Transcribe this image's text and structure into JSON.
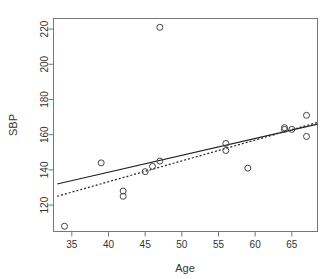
{
  "chart_data": {
    "type": "scatter",
    "title": "",
    "xlabel": "Age",
    "ylabel": "SBP",
    "xlim": [
      32.5,
      68.5
    ],
    "ylim": [
      105,
      226
    ],
    "grid": false,
    "legend": "none",
    "xticks": [
      35,
      40,
      45,
      50,
      55,
      60,
      65
    ],
    "yticks": [
      120,
      140,
      160,
      180,
      200,
      220
    ],
    "x": [
      34,
      39,
      42,
      42,
      45,
      46,
      47,
      47,
      56,
      56,
      59,
      64,
      64,
      65,
      67,
      67
    ],
    "y": [
      108,
      144,
      128,
      125,
      139,
      142,
      145,
      221,
      155,
      151,
      141,
      163,
      164,
      163,
      171,
      159
    ],
    "points": [
      {
        "x": 34,
        "y": 108
      },
      {
        "x": 39,
        "y": 144
      },
      {
        "x": 42,
        "y": 128
      },
      {
        "x": 42,
        "y": 125
      },
      {
        "x": 45,
        "y": 139
      },
      {
        "x": 46,
        "y": 142
      },
      {
        "x": 47,
        "y": 145
      },
      {
        "x": 47,
        "y": 221
      },
      {
        "x": 56,
        "y": 155
      },
      {
        "x": 56,
        "y": 151
      },
      {
        "x": 59,
        "y": 141
      },
      {
        "x": 64,
        "y": 163
      },
      {
        "x": 64,
        "y": 164
      },
      {
        "x": 65,
        "y": 163
      },
      {
        "x": 67,
        "y": 171
      },
      {
        "x": 67,
        "y": 159
      }
    ],
    "marker": "open-circle",
    "marker_radius": 3,
    "series": [
      {
        "name": "observations",
        "type": "scatter",
        "values": [
          108,
          144,
          128,
          125,
          139,
          142,
          145,
          221,
          155,
          151,
          141,
          163,
          164,
          163,
          171,
          159
        ]
      },
      {
        "name": "fit-line-solid",
        "type": "line",
        "style": "solid",
        "x": [
          33,
          68.5
        ],
        "y": [
          132,
          166
        ]
      },
      {
        "name": "fit-line-dotted",
        "type": "line",
        "style": "dotted",
        "x": [
          33,
          68.5
        ],
        "y": [
          125,
          167
        ]
      }
    ]
  },
  "axes": {
    "x": {
      "title": "Age",
      "tick_labels": [
        "35",
        "40",
        "45",
        "50",
        "55",
        "60",
        "65"
      ],
      "tick_values": [
        35,
        40,
        45,
        50,
        55,
        60,
        65
      ]
    },
    "y": {
      "title": "SBP",
      "tick_labels": [
        "120",
        "140",
        "160",
        "180",
        "200",
        "220"
      ],
      "tick_values": [
        120,
        140,
        160,
        180,
        200,
        220
      ]
    }
  },
  "style": {
    "point_stroke": "#444444",
    "line_color": "#222222",
    "frame_color": "#777777",
    "text_color": "#333333",
    "background": "#ffffff"
  }
}
